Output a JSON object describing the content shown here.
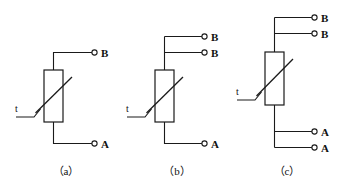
{
  "figure": {
    "background_color": "#ffffff",
    "line_color": "#1a1a1a",
    "text_color": "#111111"
  },
  "diagrams": [
    {
      "id": "a",
      "caption": "（a）",
      "component_label": "t",
      "component_type": "thermistor",
      "terminals": [
        {
          "label": "B",
          "position": "top",
          "index": 1
        },
        {
          "label": "A",
          "position": "bottom",
          "index": 1
        }
      ],
      "terminal_counts": {
        "top": 1,
        "bottom": 1
      }
    },
    {
      "id": "b",
      "caption": "（b）",
      "component_label": "t",
      "component_type": "thermistor",
      "terminals": [
        {
          "label": "B",
          "position": "top",
          "index": 1
        },
        {
          "label": "B",
          "position": "top",
          "index": 2
        },
        {
          "label": "A",
          "position": "bottom",
          "index": 1
        }
      ],
      "terminal_counts": {
        "top": 2,
        "bottom": 1
      }
    },
    {
      "id": "c",
      "caption": "（c）",
      "component_label": "t",
      "component_type": "thermistor",
      "terminals": [
        {
          "label": "B",
          "position": "top",
          "index": 1
        },
        {
          "label": "B",
          "position": "top",
          "index": 2
        },
        {
          "label": "A",
          "position": "bottom",
          "index": 1
        },
        {
          "label": "A",
          "position": "bottom",
          "index": 2
        }
      ],
      "terminal_counts": {
        "top": 2,
        "bottom": 2
      }
    }
  ]
}
